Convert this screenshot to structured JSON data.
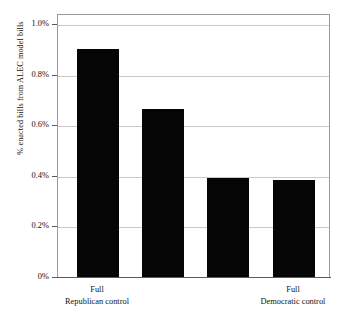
{
  "chart_data": {
    "type": "bar",
    "title": "",
    "subtitle": "",
    "xlabel": "",
    "ylabel": "% enacted bills from ALEC model bills",
    "categories": [
      "Full Republican control",
      "",
      "",
      "Full Democratic control"
    ],
    "values": [
      0.91,
      0.67,
      0.4,
      0.39
    ],
    "ylim": [
      0,
      1.0
    ],
    "ytick_values": [
      0,
      0.2,
      0.4,
      0.6,
      0.8,
      1.0
    ],
    "ytick_labels": [
      "0%",
      "0.2%",
      "0.4%",
      "0.6%",
      "0.8%",
      "1.0%"
    ],
    "value_unit": "percent",
    "grid": true,
    "grid_axis": "y",
    "legend": false,
    "bar_color": "#050505",
    "grid_color": "#c9c9c9",
    "frame_color": "#9b9b9b",
    "background_color": "#ffffff"
  },
  "axes": {
    "y_title": "% enacted bills from ALEC model bills",
    "ticks": [
      {
        "label": "1.0%",
        "value": 1.0
      },
      {
        "label": "0.8%",
        "value": 0.8
      },
      {
        "label": "0.6%",
        "value": 0.6
      },
      {
        "label": "0.4%",
        "value": 0.4
      },
      {
        "label": "0.2%",
        "value": 0.2
      },
      {
        "label": "0%",
        "value": 0
      }
    ]
  },
  "bars": [
    {
      "value": 0.91,
      "label_line1": "Full",
      "label_line2": "Republican control"
    },
    {
      "value": 0.67,
      "label_line1": "",
      "label_line2": ""
    },
    {
      "value": 0.4,
      "label_line1": "",
      "label_line2": ""
    },
    {
      "value": 0.39,
      "label_line1": "Full",
      "label_line2": "Democratic control"
    }
  ],
  "x_labels": [
    {
      "line1": "Full",
      "line2": "Republican control"
    },
    {
      "line1": "Full",
      "line2": "Democratic control"
    }
  ]
}
